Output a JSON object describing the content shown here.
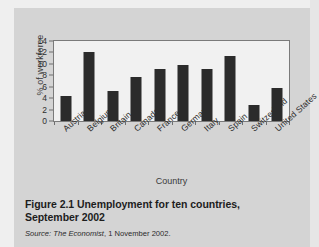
{
  "figure": {
    "caption_title": "Figure 2.1  Unemployment for ten countries, September 2002",
    "source_lead": "Source:",
    "source_publication": "The Economist",
    "source_rest": ", 1 November 2002."
  },
  "colors": {
    "page_background": "#d4d4d4",
    "plot_background": "#f1f1f1",
    "bar": "#2b2b2b",
    "axis": "#7a7a7a",
    "text": "#2b2b2b"
  },
  "chart_data": {
    "type": "bar",
    "title": "",
    "xlabel": "Country",
    "ylabel": "% of workforce",
    "categories": [
      "Austria",
      "Belgium",
      "Britain",
      "Canada",
      "France",
      "Germany",
      "Italy",
      "Spain",
      "Switzerland",
      "United States"
    ],
    "values": [
      4.3,
      12.1,
      5.2,
      7.7,
      9.1,
      9.8,
      9.1,
      11.4,
      2.8,
      5.7
    ],
    "ylim": [
      0,
      14
    ],
    "yticks": [
      0,
      2,
      4,
      6,
      8,
      10,
      12,
      14
    ],
    "ytick_labels": [
      "0",
      "2",
      "4",
      "6",
      "8",
      "10",
      "12",
      "14"
    ],
    "grid": false,
    "legend": "none"
  }
}
